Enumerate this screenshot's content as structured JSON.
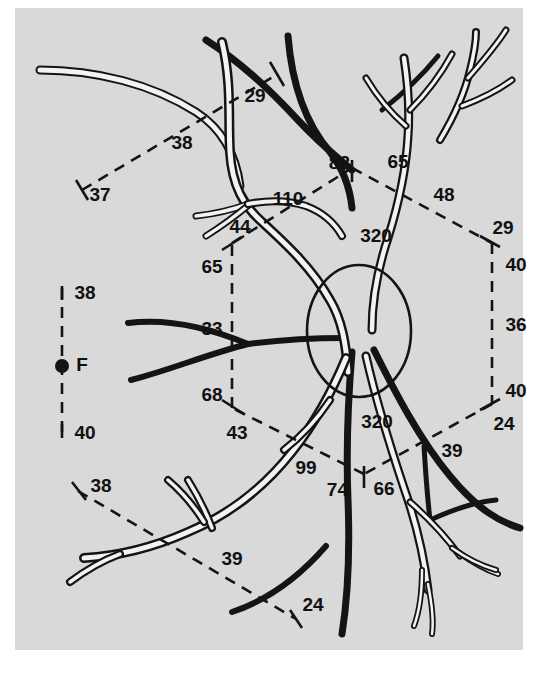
{
  "figure": {
    "background_color": "#d9d9d9",
    "page_color": "#ffffff",
    "ink_color": "#141414",
    "vessel_highlight_color": "#f3f3f3"
  },
  "markers": {
    "fovea_label": "F",
    "optic_disc_label": ""
  },
  "measurements": {
    "upper_left_chain": [
      {
        "id": "ul-29",
        "value": "29"
      },
      {
        "id": "ul-38",
        "value": "38"
      },
      {
        "id": "ul-37",
        "value": "37"
      }
    ],
    "hexagon_vertices": {
      "top": {
        "left_value": "82",
        "right_value": "65"
      },
      "upper_right": {
        "upper_value": "29",
        "lower_value": "40"
      },
      "lower_right": {
        "upper_value": "40",
        "lower_value": "24"
      },
      "upper_left": {
        "upper_value": "44",
        "lower_value": "65"
      },
      "lower_left": {
        "upper_value": "68",
        "lower_value": "43"
      },
      "bottom": {
        "left_value": "74",
        "right_value": "66"
      }
    },
    "hexagon_sides": {
      "top_right": "48",
      "right": "36",
      "bottom_right": "39",
      "bottom_left": "99",
      "left": "33",
      "top_left": "110"
    },
    "disc_arcs": {
      "upper": "320",
      "lower": "320"
    },
    "fovea_scale": {
      "upper_value": "38",
      "lower_value": "40",
      "center_label": "F"
    },
    "lower_left_chain": [
      {
        "id": "ll-38",
        "value": "38"
      },
      {
        "id": "ll-39",
        "value": "39"
      },
      {
        "id": "ll-24",
        "value": "24"
      }
    ]
  },
  "labels": [
    {
      "id": "lbl-29-top",
      "text": "29",
      "x": 255,
      "y": 97,
      "anchor": "middle"
    },
    {
      "id": "lbl-38-upper",
      "text": "38",
      "x": 182,
      "y": 144,
      "anchor": "middle"
    },
    {
      "id": "lbl-37",
      "text": "37",
      "x": 100,
      "y": 196,
      "anchor": "middle"
    },
    {
      "id": "lbl-82",
      "text": "82",
      "x": 350,
      "y": 164,
      "anchor": "end"
    },
    {
      "id": "lbl-65-top",
      "text": "65",
      "x": 398,
      "y": 163,
      "anchor": "middle"
    },
    {
      "id": "lbl-48",
      "text": "48",
      "x": 444,
      "y": 196,
      "anchor": "middle"
    },
    {
      "id": "lbl-110",
      "text": "110",
      "x": 288,
      "y": 200,
      "anchor": "middle"
    },
    {
      "id": "lbl-44",
      "text": "44",
      "x": 240,
      "y": 228,
      "anchor": "middle"
    },
    {
      "id": "lbl-320-upper",
      "text": "320",
      "x": 376,
      "y": 237,
      "anchor": "middle"
    },
    {
      "id": "lbl-29-right",
      "text": "29",
      "x": 503,
      "y": 229,
      "anchor": "middle"
    },
    {
      "id": "lbl-65-left",
      "text": "65",
      "x": 212,
      "y": 268,
      "anchor": "middle"
    },
    {
      "id": "lbl-40-upper",
      "text": "40",
      "x": 516,
      "y": 266,
      "anchor": "middle"
    },
    {
      "id": "lbl-33",
      "text": "33",
      "x": 212,
      "y": 330,
      "anchor": "middle"
    },
    {
      "id": "lbl-36",
      "text": "36",
      "x": 516,
      "y": 326,
      "anchor": "middle"
    },
    {
      "id": "lbl-68",
      "text": "68",
      "x": 212,
      "y": 396,
      "anchor": "middle"
    },
    {
      "id": "lbl-40-lower",
      "text": "40",
      "x": 516,
      "y": 392,
      "anchor": "middle"
    },
    {
      "id": "lbl-43",
      "text": "43",
      "x": 237,
      "y": 434,
      "anchor": "middle"
    },
    {
      "id": "lbl-320-lower",
      "text": "320",
      "x": 377,
      "y": 423,
      "anchor": "middle"
    },
    {
      "id": "lbl-24-right",
      "text": "24",
      "x": 504,
      "y": 425,
      "anchor": "middle"
    },
    {
      "id": "lbl-39-right",
      "text": "39",
      "x": 452,
      "y": 452,
      "anchor": "middle"
    },
    {
      "id": "lbl-99",
      "text": "99",
      "x": 306,
      "y": 469,
      "anchor": "middle"
    },
    {
      "id": "lbl-74",
      "text": "74",
      "x": 348,
      "y": 491,
      "anchor": "end"
    },
    {
      "id": "lbl-66",
      "text": "66",
      "x": 384,
      "y": 490,
      "anchor": "middle"
    },
    {
      "id": "lbl-38-fovea",
      "text": "38",
      "x": 85,
      "y": 294,
      "anchor": "middle"
    },
    {
      "id": "lbl-F",
      "text": "F",
      "x": 82,
      "y": 366,
      "anchor": "middle"
    },
    {
      "id": "lbl-40-fovea",
      "text": "40",
      "x": 85,
      "y": 434,
      "anchor": "middle"
    },
    {
      "id": "lbl-38-lower",
      "text": "38",
      "x": 101,
      "y": 487,
      "anchor": "middle"
    },
    {
      "id": "lbl-39-lower",
      "text": "39",
      "x": 232,
      "y": 560,
      "anchor": "middle"
    },
    {
      "id": "lbl-24-lower",
      "text": "24",
      "x": 313,
      "y": 606,
      "anchor": "middle"
    }
  ],
  "geometry": {
    "panel": {
      "x": 15,
      "y": 8,
      "width": 508,
      "height": 642
    },
    "optic_disc": {
      "cx": 359,
      "cy": 331,
      "rx": 52,
      "ry": 66
    },
    "fovea_dot": {
      "cx": 62,
      "cy": 366,
      "r": 7
    },
    "fovea_axis": {
      "x": 62,
      "y1": 288,
      "y2": 436
    },
    "hexagon": [
      {
        "name": "top",
        "x": 352,
        "y": 168
      },
      {
        "name": "upper-right",
        "x": 492,
        "y": 243
      },
      {
        "name": "lower-right",
        "x": 492,
        "y": 404
      },
      {
        "name": "bottom",
        "x": 364,
        "y": 474
      },
      {
        "name": "lower-left",
        "x": 232,
        "y": 408
      },
      {
        "name": "upper-left",
        "x": 232,
        "y": 243
      }
    ]
  }
}
